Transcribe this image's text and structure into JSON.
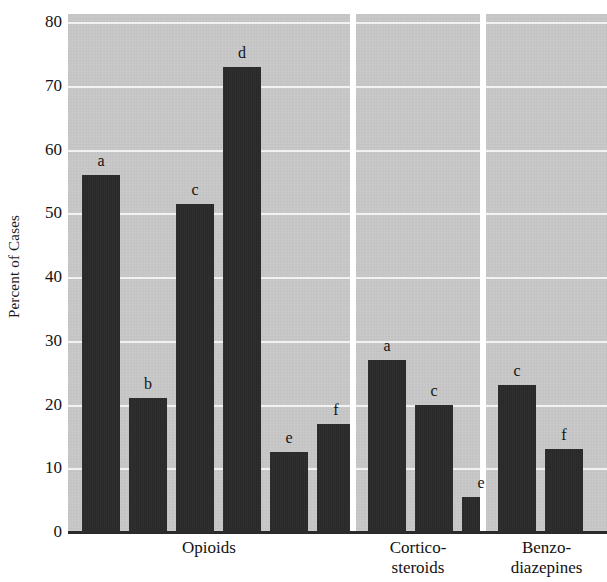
{
  "chart_data": {
    "type": "bar",
    "title": "",
    "xlabel": "",
    "ylabel": "Percent of Cases",
    "ylim": [
      0,
      80
    ],
    "ytick_values": [
      0,
      10,
      20,
      30,
      40,
      50,
      60,
      70,
      80
    ],
    "ytick_labels": [
      "0",
      "10",
      "20",
      "30",
      "40",
      "50",
      "60",
      "70",
      "80"
    ],
    "grid": "horizontal",
    "legend": "none",
    "bar_color": "#262626",
    "panel_color": "#c9c9c9",
    "gridline_color": "#f2f2f2",
    "axis_color": "#2a2a2a",
    "categories": [
      "Opioids",
      "Cortico-steroids",
      "Benzo-diazepines"
    ],
    "groups": [
      {
        "category": "Opioids",
        "label_lines": [
          "Opioids"
        ],
        "bars": [
          {
            "label": "a",
            "value": 56
          },
          {
            "label": "b",
            "value": 21
          },
          {
            "label": "c",
            "value": 51.5
          },
          {
            "label": "d",
            "value": 73
          },
          {
            "label": "e",
            "value": 12.5
          },
          {
            "label": "f",
            "value": 17
          }
        ]
      },
      {
        "category": "Cortico-steroids",
        "label_lines": [
          "Cortico-",
          "steroids"
        ],
        "bars": [
          {
            "label": "a",
            "value": 27
          },
          {
            "label": "c",
            "value": 20
          },
          {
            "label": "e",
            "value": 5.5
          }
        ]
      },
      {
        "category": "Benzo-diazepines",
        "label_lines": [
          "Benzo-",
          "diazepines"
        ],
        "bars": [
          {
            "label": "c",
            "value": 23
          },
          {
            "label": "f",
            "value": 13
          }
        ]
      }
    ]
  },
  "axis": {
    "ylabel_text": "Percent of Cases"
  },
  "categories_display": {
    "opioids_line1": "Opioids",
    "cortico_line1": "Cortico-",
    "cortico_line2": "steroids",
    "benzo_line1": "Benzo-",
    "benzo_line2": "diazepines"
  }
}
